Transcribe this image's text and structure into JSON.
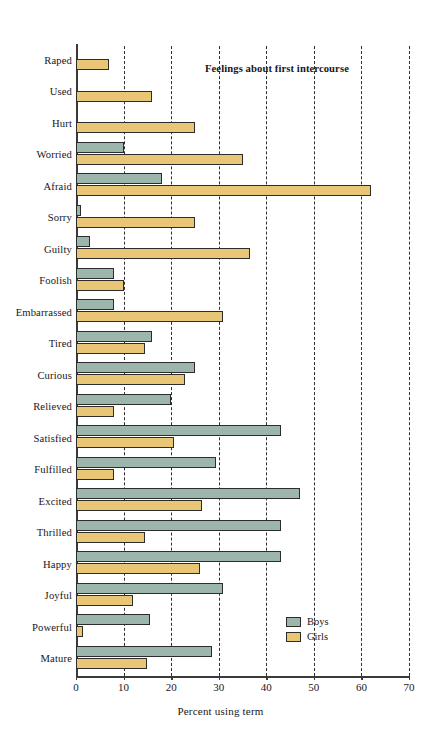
{
  "chart_data": {
    "type": "bar",
    "orientation": "horizontal",
    "title": "Feelings about first intercourse",
    "xlabel": "Percent using term",
    "ylabel": "",
    "xlim": [
      0,
      70
    ],
    "xticks": [
      0,
      10,
      20,
      30,
      40,
      50,
      60,
      70
    ],
    "grid": "vertical-dashed",
    "legend_position": "bottom-right",
    "categories": [
      "Raped",
      "Used",
      "Hurt",
      "Worried",
      "Afraid",
      "Sorry",
      "Guilty",
      "Foolish",
      "Embarrassed",
      "Tired",
      "Curious",
      "Relieved",
      "Satisfied",
      "Fulfilled",
      "Excited",
      "Thrilled",
      "Happy",
      "Joyful",
      "Powerful",
      "Mature"
    ],
    "series": [
      {
        "name": "Boys",
        "color": "#9db6ac",
        "values": [
          0,
          0,
          0,
          10,
          18,
          1,
          3,
          8,
          8,
          16,
          25,
          20,
          43,
          29.5,
          47,
          43,
          43,
          31,
          15.5,
          28.5
        ]
      },
      {
        "name": "Girls",
        "color": "#e8c675",
        "values": [
          7,
          16,
          25,
          35,
          62,
          25,
          36.5,
          10,
          31,
          14.5,
          23,
          8,
          20.5,
          8,
          26.5,
          14.5,
          26,
          12,
          1.5,
          15
        ]
      }
    ]
  },
  "legend": {
    "entries": [
      {
        "label": "Boys",
        "color": "#9db6ac"
      },
      {
        "label": "Girls",
        "color": "#e8c675"
      }
    ]
  },
  "colors": {
    "boys": "#9db6ac",
    "girls": "#e8c675",
    "axis": "#3a3a3a",
    "gridline": "#2f2f33",
    "background": "#ffffff"
  }
}
